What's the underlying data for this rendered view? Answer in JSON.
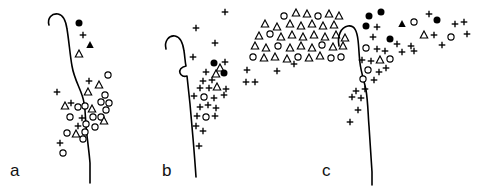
{
  "figure": {
    "name": "three-panel-distribution-map",
    "width": 482,
    "height": 188,
    "background_color": "#ffffff",
    "ink_color": "#000000"
  },
  "marker_legend": {
    "filled_circle": "filled-circle",
    "open_circle": "open-circle",
    "filled_triangle": "filled-triangle",
    "open_triangle": "open-triangle",
    "plus": "plus"
  },
  "panels": [
    {
      "id": "a",
      "label": "a",
      "label_x": 10,
      "label_y": 176,
      "origin_x": 0,
      "width": 155,
      "coastline": "M 49 25 C 47 18 52 13 58 14 C 64 15 66 22 67 29 C 69 41 70 55 72 66 C 74 78 79 86 82 95 C 86 106 85 116 86 126 C 87 138 89 150 90 163 C 90 172 90 178 90 183",
      "points": [
        {
          "x": 79,
          "y": 23,
          "type": "filled-circle"
        },
        {
          "x": 83,
          "y": 35,
          "type": "plus"
        },
        {
          "x": 90,
          "y": 45,
          "type": "filled-triangle"
        },
        {
          "x": 79,
          "y": 54,
          "type": "open-triangle"
        },
        {
          "x": 108,
          "y": 75,
          "type": "open-circle"
        },
        {
          "x": 89,
          "y": 81,
          "type": "plus"
        },
        {
          "x": 99,
          "y": 85,
          "type": "open-triangle"
        },
        {
          "x": 88,
          "y": 92,
          "type": "open-triangle"
        },
        {
          "x": 105,
          "y": 95,
          "type": "open-circle"
        },
        {
          "x": 57,
          "y": 92,
          "type": "plus"
        },
        {
          "x": 101,
          "y": 102,
          "type": "open-circle"
        },
        {
          "x": 109,
          "y": 103,
          "type": "open-circle"
        },
        {
          "x": 65,
          "y": 106,
          "type": "open-triangle"
        },
        {
          "x": 71,
          "y": 103,
          "type": "plus"
        },
        {
          "x": 78,
          "y": 107,
          "type": "open-circle"
        },
        {
          "x": 85,
          "y": 106,
          "type": "open-circle"
        },
        {
          "x": 92,
          "y": 109,
          "type": "open-triangle"
        },
        {
          "x": 106,
          "y": 110,
          "type": "open-circle"
        },
        {
          "x": 70,
          "y": 117,
          "type": "open-circle"
        },
        {
          "x": 82,
          "y": 118,
          "type": "plus"
        },
        {
          "x": 93,
          "y": 117,
          "type": "open-circle"
        },
        {
          "x": 101,
          "y": 117,
          "type": "open-circle"
        },
        {
          "x": 104,
          "y": 121,
          "type": "open-triangle"
        },
        {
          "x": 78,
          "y": 126,
          "type": "plus"
        },
        {
          "x": 86,
          "y": 124,
          "type": "open-circle"
        },
        {
          "x": 95,
          "y": 127,
          "type": "open-circle"
        },
        {
          "x": 67,
          "y": 133,
          "type": "open-circle"
        },
        {
          "x": 76,
          "y": 134,
          "type": "open-triangle"
        },
        {
          "x": 85,
          "y": 132,
          "type": "open-circle"
        },
        {
          "x": 83,
          "y": 139,
          "type": "open-circle"
        },
        {
          "x": 60,
          "y": 143,
          "type": "plus"
        },
        {
          "x": 63,
          "y": 153,
          "type": "open-circle"
        }
      ]
    },
    {
      "id": "b",
      "label": "b",
      "label_x": 162,
      "label_y": 176,
      "origin_x": 0,
      "width": 160,
      "coastline": "M 166 49 C 164 41 169 35 175 36 C 181 37 183 44 184 51 C 185 57 185 62 186 66 C 181 67 179 70 180 73 C 181 76 184 77 187 76 C 188 85 189 95 190 104 C 191 116 192 127 193 138 C 194 150 195 162 196 177",
      "points": [
        {
          "x": 225,
          "y": 12,
          "type": "plus"
        },
        {
          "x": 284,
          "y": 16,
          "type": "open-circle"
        },
        {
          "x": 296,
          "y": 13,
          "type": "open-triangle"
        },
        {
          "x": 307,
          "y": 14,
          "type": "open-triangle"
        },
        {
          "x": 318,
          "y": 16,
          "type": "open-circle"
        },
        {
          "x": 329,
          "y": 14,
          "type": "open-triangle"
        },
        {
          "x": 339,
          "y": 16,
          "type": "open-triangle"
        },
        {
          "x": 265,
          "y": 24,
          "type": "open-triangle"
        },
        {
          "x": 277,
          "y": 27,
          "type": "open-triangle"
        },
        {
          "x": 290,
          "y": 24,
          "type": "open-triangle"
        },
        {
          "x": 301,
          "y": 26,
          "type": "open-triangle"
        },
        {
          "x": 312,
          "y": 24,
          "type": "open-triangle"
        },
        {
          "x": 323,
          "y": 26,
          "type": "open-triangle"
        },
        {
          "x": 334,
          "y": 25,
          "type": "open-triangle"
        },
        {
          "x": 196,
          "y": 28,
          "type": "plus"
        },
        {
          "x": 259,
          "y": 36,
          "type": "open-triangle"
        },
        {
          "x": 270,
          "y": 34,
          "type": "open-circle"
        },
        {
          "x": 281,
          "y": 37,
          "type": "open-triangle"
        },
        {
          "x": 292,
          "y": 35,
          "type": "open-triangle"
        },
        {
          "x": 303,
          "y": 37,
          "type": "open-triangle"
        },
        {
          "x": 314,
          "y": 35,
          "type": "open-triangle"
        },
        {
          "x": 325,
          "y": 37,
          "type": "open-triangle"
        },
        {
          "x": 336,
          "y": 35,
          "type": "open-triangle"
        },
        {
          "x": 345,
          "y": 38,
          "type": "open-triangle"
        },
        {
          "x": 215,
          "y": 43,
          "type": "plus"
        },
        {
          "x": 255,
          "y": 46,
          "type": "open-triangle"
        },
        {
          "x": 266,
          "y": 48,
          "type": "open-triangle"
        },
        {
          "x": 278,
          "y": 46,
          "type": "open-circle"
        },
        {
          "x": 290,
          "y": 48,
          "type": "open-triangle"
        },
        {
          "x": 301,
          "y": 46,
          "type": "open-triangle"
        },
        {
          "x": 312,
          "y": 48,
          "type": "open-triangle"
        },
        {
          "x": 322,
          "y": 45,
          "type": "open-circle"
        },
        {
          "x": 333,
          "y": 47,
          "type": "open-triangle"
        },
        {
          "x": 343,
          "y": 46,
          "type": "open-triangle"
        },
        {
          "x": 193,
          "y": 57,
          "type": "plus"
        },
        {
          "x": 253,
          "y": 57,
          "type": "open-circle"
        },
        {
          "x": 264,
          "y": 58,
          "type": "open-triangle"
        },
        {
          "x": 275,
          "y": 57,
          "type": "open-triangle"
        },
        {
          "x": 287,
          "y": 59,
          "type": "open-triangle"
        },
        {
          "x": 298,
          "y": 57,
          "type": "open-circle"
        },
        {
          "x": 309,
          "y": 58,
          "type": "open-triangle"
        },
        {
          "x": 320,
          "y": 56,
          "type": "open-triangle"
        },
        {
          "x": 331,
          "y": 58,
          "type": "open-circle"
        },
        {
          "x": 341,
          "y": 57,
          "type": "open-circle"
        },
        {
          "x": 214,
          "y": 63,
          "type": "filled-circle"
        },
        {
          "x": 225,
          "y": 62,
          "type": "plus"
        },
        {
          "x": 220,
          "y": 68,
          "type": "open-triangle"
        },
        {
          "x": 294,
          "y": 64,
          "type": "plus"
        },
        {
          "x": 206,
          "y": 72,
          "type": "plus"
        },
        {
          "x": 216,
          "y": 74,
          "type": "open-triangle"
        },
        {
          "x": 224,
          "y": 73,
          "type": "filled-circle"
        },
        {
          "x": 247,
          "y": 70,
          "type": "plus"
        },
        {
          "x": 277,
          "y": 71,
          "type": "plus"
        },
        {
          "x": 203,
          "y": 81,
          "type": "plus"
        },
        {
          "x": 212,
          "y": 80,
          "type": "plus"
        },
        {
          "x": 246,
          "y": 82,
          "type": "plus"
        },
        {
          "x": 255,
          "y": 82,
          "type": "plus"
        },
        {
          "x": 200,
          "y": 88,
          "type": "plus"
        },
        {
          "x": 209,
          "y": 88,
          "type": "plus"
        },
        {
          "x": 217,
          "y": 87,
          "type": "open-triangle"
        },
        {
          "x": 226,
          "y": 89,
          "type": "plus"
        },
        {
          "x": 194,
          "y": 96,
          "type": "plus"
        },
        {
          "x": 204,
          "y": 97,
          "type": "open-circle"
        },
        {
          "x": 214,
          "y": 98,
          "type": "plus"
        },
        {
          "x": 224,
          "y": 95,
          "type": "plus"
        },
        {
          "x": 200,
          "y": 107,
          "type": "plus"
        },
        {
          "x": 208,
          "y": 105,
          "type": "plus"
        },
        {
          "x": 216,
          "y": 108,
          "type": "plus"
        },
        {
          "x": 197,
          "y": 116,
          "type": "plus"
        },
        {
          "x": 206,
          "y": 117,
          "type": "open-circle"
        },
        {
          "x": 215,
          "y": 116,
          "type": "plus"
        },
        {
          "x": 196,
          "y": 126,
          "type": "plus"
        },
        {
          "x": 203,
          "y": 131,
          "type": "plus"
        },
        {
          "x": 199,
          "y": 146,
          "type": "plus"
        }
      ]
    },
    {
      "id": "c",
      "label": "c",
      "label_x": 322,
      "label_y": 176,
      "origin_x": 0,
      "width": 167,
      "coastline": "M 339 46 C 337 36 341 27 348 26 C 355 25 357 32 358 40 C 359 48 359 56 360 63 C 361 72 364 80 366 90 C 368 102 368 114 369 126 C 370 140 371 155 372 172 C 372 178 372 182 372 185",
      "points": [
        {
          "x": 369,
          "y": 16,
          "type": "filled-circle"
        },
        {
          "x": 381,
          "y": 12,
          "type": "filled-circle"
        },
        {
          "x": 429,
          "y": 14,
          "type": "plus"
        },
        {
          "x": 366,
          "y": 26,
          "type": "filled-circle"
        },
        {
          "x": 377,
          "y": 27,
          "type": "plus"
        },
        {
          "x": 402,
          "y": 24,
          "type": "filled-triangle"
        },
        {
          "x": 414,
          "y": 22,
          "type": "open-circle"
        },
        {
          "x": 437,
          "y": 20,
          "type": "filled-circle"
        },
        {
          "x": 455,
          "y": 24,
          "type": "plus"
        },
        {
          "x": 464,
          "y": 22,
          "type": "plus"
        },
        {
          "x": 373,
          "y": 37,
          "type": "plus"
        },
        {
          "x": 390,
          "y": 39,
          "type": "filled-circle"
        },
        {
          "x": 424,
          "y": 35,
          "type": "open-triangle"
        },
        {
          "x": 434,
          "y": 35,
          "type": "plus"
        },
        {
          "x": 451,
          "y": 37,
          "type": "open-circle"
        },
        {
          "x": 467,
          "y": 34,
          "type": "plus"
        },
        {
          "x": 366,
          "y": 48,
          "type": "open-circle"
        },
        {
          "x": 377,
          "y": 49,
          "type": "plus"
        },
        {
          "x": 397,
          "y": 44,
          "type": "plus"
        },
        {
          "x": 411,
          "y": 46,
          "type": "plus"
        },
        {
          "x": 442,
          "y": 45,
          "type": "plus"
        },
        {
          "x": 385,
          "y": 51,
          "type": "plus"
        },
        {
          "x": 362,
          "y": 60,
          "type": "plus"
        },
        {
          "x": 371,
          "y": 61,
          "type": "plus"
        },
        {
          "x": 380,
          "y": 60,
          "type": "open-triangle"
        },
        {
          "x": 390,
          "y": 59,
          "type": "open-circle"
        },
        {
          "x": 402,
          "y": 52,
          "type": "plus"
        },
        {
          "x": 414,
          "y": 51,
          "type": "plus"
        },
        {
          "x": 386,
          "y": 68,
          "type": "plus"
        },
        {
          "x": 368,
          "y": 70,
          "type": "open-circle"
        },
        {
          "x": 379,
          "y": 72,
          "type": "plus"
        },
        {
          "x": 363,
          "y": 79,
          "type": "open-circle"
        },
        {
          "x": 374,
          "y": 80,
          "type": "plus"
        },
        {
          "x": 356,
          "y": 91,
          "type": "plus"
        },
        {
          "x": 365,
          "y": 89,
          "type": "plus"
        },
        {
          "x": 352,
          "y": 97,
          "type": "plus"
        },
        {
          "x": 361,
          "y": 98,
          "type": "plus"
        },
        {
          "x": 358,
          "y": 110,
          "type": "plus"
        },
        {
          "x": 350,
          "y": 122,
          "type": "plus"
        }
      ]
    }
  ]
}
